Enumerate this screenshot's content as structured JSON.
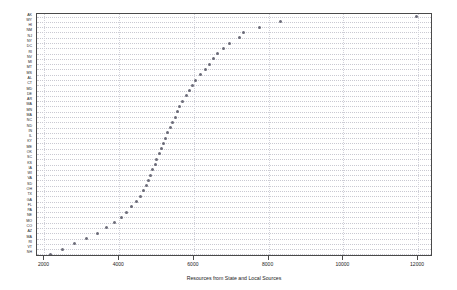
{
  "chart_data": {
    "type": "scatter",
    "title": "",
    "subtitle": "",
    "xlabel": "Resources from State and Local Sources",
    "ylabel": "",
    "xlim": [
      1800,
      12400
    ],
    "xticks": [
      2000,
      4000,
      6000,
      8000,
      10000,
      12000
    ],
    "xtick_labels": [
      "2000",
      "4000",
      "6000",
      "8000",
      "10000",
      "12000"
    ],
    "grid": true,
    "grid_style": "dotted",
    "legend": "none",
    "orientation": "horizontal-dot-plot",
    "marker_color": "#6b6b78",
    "frame_color": "#4a4a4a",
    "categories": [
      "AK",
      "WY",
      "HI",
      "NM",
      "NJ",
      "NY",
      "DC",
      "RI",
      "NV",
      "MI",
      "MT",
      "MS",
      "AL",
      "CT",
      "MD",
      "DE",
      "AR",
      "WA",
      "MN",
      "MA",
      "NC",
      "ND",
      "IN",
      "IL",
      "KY",
      "ME",
      "OK",
      "SC",
      "KS",
      "IA",
      "WI",
      "VA",
      "SD",
      "OH",
      "TX",
      "GA",
      "FL",
      "PA",
      "NE",
      "MO",
      "CO",
      "AZ",
      "MA2",
      "RI2",
      "VT",
      "NH"
    ],
    "values": [
      11950,
      8330,
      7760,
      7340,
      7220,
      6950,
      6780,
      6640,
      6520,
      6420,
      6300,
      6180,
      6050,
      5960,
      5880,
      5800,
      5700,
      5620,
      5560,
      5500,
      5430,
      5360,
      5290,
      5230,
      5180,
      5120,
      5070,
      5010,
      4960,
      4900,
      4850,
      4790,
      4720,
      4650,
      4560,
      4460,
      4340,
      4200,
      4050,
      3870,
      3660,
      3430,
      3120,
      2800,
      2480,
      2170
    ],
    "category_labels": [
      "AK",
      "WY",
      "HI",
      "NM",
      "NJ",
      "NY",
      "DC",
      "RI",
      "NV",
      "MI",
      "MT",
      "MS",
      "AL",
      "CT",
      "MD",
      "DE",
      "AR",
      "WA",
      "MN",
      "MA",
      "NC",
      "ND",
      "IN",
      "IL",
      "KY",
      "ME",
      "OK",
      "SC",
      "KS",
      "IA",
      "WI",
      "VA",
      "SD",
      "OH",
      "TX",
      "GA",
      "FL",
      "PA",
      "NE",
      "MO",
      "CO",
      "AZ",
      "MA",
      "RI",
      "VT",
      "NH"
    ],
    "n_points": 46
  },
  "axis": {
    "x_title": "Resources from State and Local Sources"
  }
}
